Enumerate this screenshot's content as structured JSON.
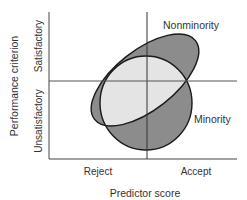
{
  "diagram": {
    "x_axis_title": "Predictor score",
    "y_axis_title": "Performance criterion",
    "x_categories": [
      "Reject",
      "Accept"
    ],
    "y_categories": [
      "Unsatisfactory",
      "Satisfactory"
    ],
    "groups": [
      {
        "name": "Nonminority",
        "shape": "tilted ellipse"
      },
      {
        "name": "Minority",
        "shape": "circle"
      }
    ],
    "colors": {
      "overlap_fill": "#e4e4e4",
      "nonoverlap_fill": "#8c8c8c",
      "stroke": "#1a1a1a",
      "axis": "#444444",
      "text": "#333333"
    }
  }
}
